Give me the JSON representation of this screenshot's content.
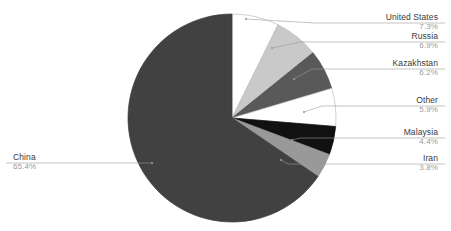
{
  "chart_data": {
    "type": "pie",
    "title": "",
    "subtitle": "",
    "xlabel": "",
    "ylabel": "",
    "legend_position": "none",
    "grid": false,
    "unit": "%",
    "categories": [
      "United States",
      "Russia",
      "Kazakhstan",
      "Other",
      "Malaysia",
      "Iran",
      "China"
    ],
    "values": [
      7.3,
      6.9,
      6.2,
      5.9,
      4.4,
      3.8,
      65.4
    ],
    "slices": [
      {
        "label": "United States",
        "value": 7.3,
        "value_text": "7.3%",
        "color": "#ffffff",
        "stroke": "#bdbdbd",
        "start_angle": 0,
        "end_angle": 26.28,
        "label_side": "right",
        "label_x": 438,
        "label_y": 12,
        "leader_y": 23,
        "leader_x_end": 315,
        "anchor_x": 246,
        "anchor_y": 19
      },
      {
        "label": "Russia",
        "value": 6.9,
        "value_text": "6.9%",
        "color": "#c9c9c9",
        "stroke": "#bdbdbd",
        "start_angle": 26.28,
        "end_angle": 51.12,
        "label_side": "right",
        "label_x": 438,
        "label_y": 31,
        "leader_y": 42,
        "leader_x_end": 300,
        "anchor_x": 272,
        "anchor_y": 48
      },
      {
        "label": "Kazakhstan",
        "value": 6.2,
        "value_text": "6.2%",
        "color": "#595959",
        "stroke": "#4a4a4a",
        "start_angle": 51.12,
        "end_angle": 73.44,
        "label_side": "right",
        "label_x": 438,
        "label_y": 58,
        "leader_y": 69,
        "leader_x_end": 312,
        "anchor_x": 294,
        "anchor_y": 79
      },
      {
        "label": "Other",
        "value": 5.9,
        "value_text": "5.9%",
        "color": "#ffffff",
        "stroke": "#bdbdbd",
        "start_angle": 73.44,
        "end_angle": 94.68,
        "label_side": "right",
        "label_x": 438,
        "label_y": 95,
        "leader_y": 106,
        "leader_x_end": 322,
        "anchor_x": 304,
        "anchor_y": 112
      },
      {
        "label": "Malaysia",
        "value": 4.4,
        "value_text": "4.4%",
        "color": "#111111",
        "stroke": "#111111",
        "start_angle": 94.68,
        "end_angle": 110.52,
        "label_side": "right",
        "label_x": 438,
        "label_y": 127,
        "leader_y": 138,
        "leader_x_end": 300,
        "anchor_x": 292,
        "anchor_y": 140
      },
      {
        "label": "Iran",
        "value": 3.8,
        "value_text": "3.8%",
        "color": "#999999",
        "stroke": "#8a8a8a",
        "start_angle": 110.52,
        "end_angle": 124.2,
        "label_side": "right",
        "label_x": 438,
        "label_y": 153,
        "leader_y": 164,
        "leader_x_end": 288,
        "anchor_x": 281,
        "anchor_y": 160
      },
      {
        "label": "China",
        "value": 65.4,
        "value_text": "65.4%",
        "color": "#414141",
        "stroke": "#3a3a3a",
        "start_angle": 124.2,
        "end_angle": 360,
        "label_side": "left",
        "label_x": 13,
        "label_y": 152,
        "leader_y": 163,
        "leader_x_end": 152,
        "anchor_x": 152,
        "anchor_y": 163
      }
    ],
    "geometry": {
      "center_x": 232,
      "center_y": 118,
      "radius": 104
    },
    "leader_color": "#9a9a9a"
  }
}
